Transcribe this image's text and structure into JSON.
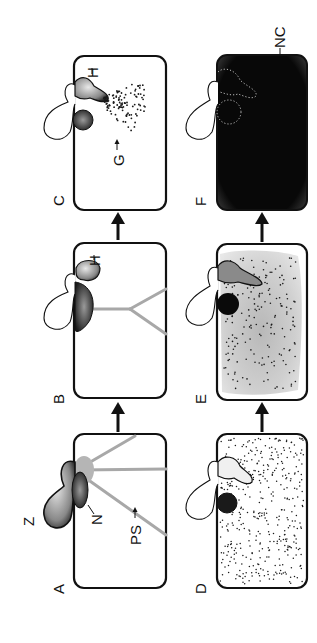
{
  "figure": {
    "orientation": "rotated-90-ccw",
    "panels": [
      {
        "id": "A",
        "label": "A",
        "annotations": [
          "Z",
          "N",
          "PS"
        ],
        "description": "Zoospore attached to host cell; nucleus (N) with protoplasmic strands (PS)"
      },
      {
        "id": "B",
        "label": "B",
        "annotations": [
          "H"
        ],
        "description": "Host nucleus migrates; haustorium (H) forms, strands retract"
      },
      {
        "id": "C",
        "label": "C",
        "annotations": [
          "H",
          "G"
        ],
        "description": "Haustorium (H) extends; granules (G) dispersed in cytoplasm"
      },
      {
        "id": "D",
        "label": "D",
        "annotations": [],
        "description": "Cytoplasm filled with evenly scattered granules"
      },
      {
        "id": "E",
        "label": "E",
        "annotations": [],
        "description": "Cytoplasm increasingly dense and stippled"
      },
      {
        "id": "F",
        "label": "F",
        "annotations": [
          "NC"
        ],
        "description": "Host cell fully darkened (necrotic cell, NC)"
      }
    ],
    "sequence": [
      [
        "A",
        "B",
        "C"
      ],
      [
        "D",
        "E",
        "F"
      ]
    ],
    "labels": {
      "Z": "Z",
      "N": "N",
      "PS": "PS",
      "H": "H",
      "G": "G",
      "NC": "NC",
      "A": "A",
      "B": "B",
      "C": "C",
      "D": "D",
      "E": "E",
      "F": "F"
    },
    "colors": {
      "ink": "#111111",
      "strand": "#a8a8a8",
      "necrotic_fill": "#0a0a0a",
      "stipple_fill": "#d0d0d0",
      "background": "#ffffff"
    }
  }
}
